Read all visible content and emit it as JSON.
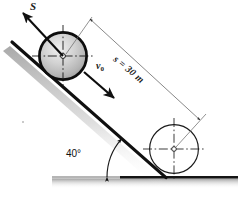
{
  "figure": {
    "type": "physics-diagram",
    "background_color": "#ffffff",
    "ink_color": "#111111",
    "shadow_color": "#b5b5b5"
  },
  "labels": {
    "displacement_vector": "S",
    "initial_velocity": "v",
    "initial_velocity_subscript": "0",
    "distance": "s = 30 m",
    "angle": "40°"
  },
  "geometry": {
    "incline_angle_deg": 40,
    "distance_value": 30,
    "distance_unit": "m",
    "incline_start": {
      "x": 12,
      "y": 42
    },
    "incline_end": {
      "x": 165,
      "y": 177
    },
    "ground_y": 177,
    "ground_x_start": 52,
    "ground_x_end": 238
  },
  "bodies": [
    {
      "name": "wheel-upper",
      "cx": 63,
      "cy": 56,
      "r": 24,
      "filled": true,
      "stroke_width": 2.6
    },
    {
      "name": "wheel-lower",
      "cx": 174,
      "cy": 149,
      "r": 24,
      "filled": false,
      "stroke_width": 1.1
    }
  ],
  "dimension_line": {
    "name": "distance-dimension",
    "from": {
      "x": 90,
      "y": 19
    },
    "to": {
      "x": 200,
      "y": 119
    },
    "arrow_both_ends": true
  },
  "vectors": [
    {
      "name": "displacement-arrow",
      "from": {
        "x": 63,
        "y": 56
      },
      "to": {
        "x": 23,
        "y": 13
      },
      "label": "S"
    },
    {
      "name": "velocity-arrow",
      "from": {
        "x": 84,
        "y": 73
      },
      "to": {
        "x": 113,
        "y": 98
      },
      "label": "v0"
    }
  ],
  "angle_marker": {
    "name": "incline-angle-arc",
    "vertex": {
      "x": 165,
      "y": 177
    },
    "value": "40°",
    "radius": 58
  }
}
